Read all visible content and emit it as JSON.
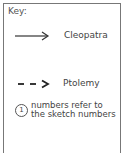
{
  "key": {
    "title": "Key:",
    "entries": [
      {
        "icon": "solid-arrow-icon",
        "label": "Cleopatra"
      },
      {
        "icon": "dashed-arrow-icon",
        "label": "Ptolemy"
      }
    ],
    "note": {
      "number": "1",
      "line1": "numbers refer to",
      "line2": "the sketch numbers"
    }
  }
}
